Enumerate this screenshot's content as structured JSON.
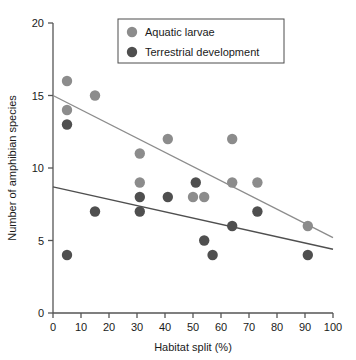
{
  "chart_data": {
    "type": "scatter",
    "title": "",
    "xlabel": "Habitat split (%)",
    "ylabel": "Number of amphibian species",
    "xlim": [
      0,
      100
    ],
    "ylim": [
      0,
      20
    ],
    "xticks": [
      0,
      10,
      20,
      30,
      40,
      50,
      60,
      70,
      80,
      90,
      100
    ],
    "yticks": [
      0,
      5,
      10,
      15,
      20
    ],
    "grid": false,
    "legend_position": "top-center",
    "colors": {
      "aquatic": "#8c8c8c",
      "terrestrial": "#4f4f4f",
      "axis": "#555555",
      "text": "#1a1a1a",
      "legend_border": "#4d4d4d",
      "background": "#ffffff"
    },
    "series": [
      {
        "name": "Aquatic larvae",
        "color": "#8c8c8c",
        "points": [
          {
            "x": 5,
            "y": 16
          },
          {
            "x": 5,
            "y": 14
          },
          {
            "x": 15,
            "y": 15
          },
          {
            "x": 31,
            "y": 11
          },
          {
            "x": 31,
            "y": 9
          },
          {
            "x": 41,
            "y": 12
          },
          {
            "x": 50,
            "y": 8
          },
          {
            "x": 54,
            "y": 8
          },
          {
            "x": 64,
            "y": 12
          },
          {
            "x": 64,
            "y": 9
          },
          {
            "x": 73,
            "y": 9
          },
          {
            "x": 91,
            "y": 6
          }
        ],
        "trend": {
          "x1": 0,
          "y1": 15.0,
          "x2": 100,
          "y2": 5.2
        }
      },
      {
        "name": "Terrestrial development",
        "color": "#4f4f4f",
        "points": [
          {
            "x": 5,
            "y": 13
          },
          {
            "x": 5,
            "y": 4
          },
          {
            "x": 15,
            "y": 7
          },
          {
            "x": 31,
            "y": 8
          },
          {
            "x": 31,
            "y": 7
          },
          {
            "x": 41,
            "y": 8
          },
          {
            "x": 51,
            "y": 9
          },
          {
            "x": 54,
            "y": 5
          },
          {
            "x": 57,
            "y": 4
          },
          {
            "x": 64,
            "y": 6
          },
          {
            "x": 73,
            "y": 7
          },
          {
            "x": 91,
            "y": 4
          }
        ],
        "trend": {
          "x1": 0,
          "y1": 8.7,
          "x2": 100,
          "y2": 4.4
        }
      }
    ]
  },
  "legend": {
    "items": [
      {
        "label": "Aquatic larvae",
        "color": "#8c8c8c"
      },
      {
        "label": "Terrestrial development",
        "color": "#4f4f4f"
      }
    ]
  },
  "axes": {
    "x": {
      "title": "Habitat split (%)",
      "labels": [
        "0",
        "10",
        "20",
        "30",
        "40",
        "50",
        "60",
        "70",
        "80",
        "90",
        "100"
      ]
    },
    "y": {
      "title": "Number of amphibian species",
      "labels": [
        "0",
        "5",
        "10",
        "15",
        "20"
      ]
    }
  }
}
